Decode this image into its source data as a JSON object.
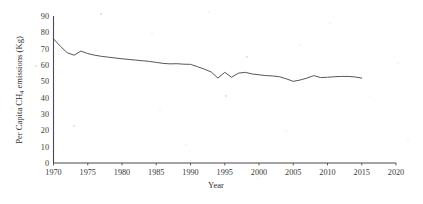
{
  "chart_data": {
    "type": "line",
    "title": "",
    "xlabel": "Year",
    "ylabel": "Per Capita CH4 emissions (Kg)",
    "ylabel_parts": {
      "pre": "Per Capita CH",
      "sub": "4",
      "post": " emissions (Kg)"
    },
    "xlim": [
      1970,
      2020
    ],
    "ylim": [
      0,
      90
    ],
    "xticks": [
      1970,
      1975,
      1980,
      1985,
      1990,
      1995,
      2000,
      2005,
      2010,
      2015,
      2020
    ],
    "yticks": [
      0,
      10,
      20,
      30,
      40,
      50,
      60,
      70,
      80,
      90
    ],
    "grid": false,
    "legend": false,
    "line_color": "#55565a",
    "series": [
      {
        "name": "Per Capita CH4 emissions",
        "x": [
          1970,
          1971,
          1972,
          1973,
          1974,
          1975,
          1976,
          1977,
          1978,
          1979,
          1980,
          1981,
          1982,
          1983,
          1984,
          1985,
          1986,
          1987,
          1988,
          1989,
          1990,
          1991,
          1992,
          1993,
          1994,
          1995,
          1996,
          1997,
          1998,
          1999,
          2000,
          2001,
          2002,
          2003,
          2004,
          2005,
          2006,
          2007,
          2008,
          2009,
          2010,
          2011,
          2012,
          2013,
          2014,
          2015
        ],
        "values": [
          76.0,
          71.5,
          67.5,
          66.0,
          68.5,
          67.0,
          66.0,
          65.3,
          64.8,
          64.3,
          63.8,
          63.4,
          63.0,
          62.6,
          62.2,
          61.6,
          61.0,
          60.7,
          60.8,
          60.5,
          60.4,
          59.0,
          57.5,
          55.8,
          52.0,
          55.5,
          52.5,
          55.0,
          55.5,
          54.5,
          54.0,
          53.5,
          53.3,
          52.8,
          51.5,
          50.0,
          50.8,
          52.0,
          53.5,
          52.3,
          52.5,
          52.8,
          53.0,
          53.0,
          52.7,
          52.0
        ]
      }
    ]
  },
  "axes": {
    "x_title": "Year",
    "y_title_pre": "Per Capita CH",
    "y_title_sub": "4",
    "y_title_post": " emissions (Kg)"
  }
}
